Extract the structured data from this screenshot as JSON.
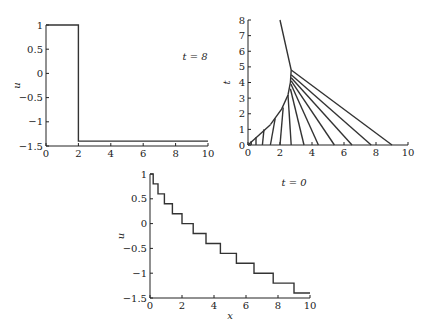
{
  "chart_data": [
    {
      "type": "line",
      "title": "",
      "annotation": "t = 8",
      "xlabel": "",
      "ylabel": "u",
      "xlim": [
        0,
        10
      ],
      "ylim": [
        -1.5,
        1
      ],
      "xticks": [
        "0",
        "2",
        "4",
        "6",
        "8",
        "10"
      ],
      "yticks": [
        "1",
        "0.5",
        "0",
        "−0.5",
        "−1",
        "−1.5"
      ],
      "series": [
        {
          "name": "u(x, t=8)",
          "x": [
            0,
            2,
            2,
            10
          ],
          "y": [
            1,
            1,
            -1.4,
            -1.4
          ]
        }
      ]
    },
    {
      "type": "line",
      "title": "",
      "annotation": "",
      "xlabel": "",
      "ylabel": "t",
      "xlim": [
        0,
        10
      ],
      "ylim": [
        0,
        8
      ],
      "xticks": [
        "0",
        "2",
        "4",
        "6",
        "8",
        "10"
      ],
      "yticks": [
        "0",
        "1",
        "2",
        "3",
        "4",
        "5",
        "6",
        "7",
        "8"
      ],
      "description": "Characteristic lines from x0 = 0, 0.2, 0.5, 0.9, 1.4, 2.0, 2.7, 3.5, 4.4, 5.4, 6.5, 7.7, 9.0 converging into a shock curve, shock continuing to (2, 8)",
      "series": [
        {
          "name": "characteristics",
          "x0": [
            0,
            0.2,
            0.5,
            0.9,
            1.4,
            2.0,
            2.7,
            3.5,
            4.4,
            5.4,
            6.5,
            7.7,
            9.0
          ]
        }
      ]
    },
    {
      "type": "line",
      "title": "",
      "annotation": "t = 0",
      "xlabel": "x",
      "ylabel": "u",
      "xlim": [
        0,
        10
      ],
      "ylim": [
        -1.5,
        1
      ],
      "xticks": [
        "0",
        "2",
        "4",
        "6",
        "8",
        "10"
      ],
      "yticks": [
        "1",
        "0.5",
        "0",
        "−0.5",
        "−1",
        "−1.5"
      ],
      "series": [
        {
          "name": "u(x, t=0)",
          "step_x": [
            0,
            0.2,
            0.5,
            0.9,
            1.4,
            2.0,
            2.7,
            3.5,
            4.4,
            5.4,
            6.5,
            7.7,
            9.0,
            10
          ],
          "step_y": [
            1,
            0.8,
            0.6,
            0.4,
            0.2,
            0,
            -0.2,
            -0.4,
            -0.6,
            -0.8,
            -1,
            -1.2,
            -1.4
          ]
        }
      ]
    }
  ],
  "labels": {
    "p1_annot": "t = 8",
    "p1_ylabel": "u",
    "p2_ylabel": "t",
    "p3_annot": "t = 0",
    "p3_ylabel": "u",
    "p3_xlabel": "x"
  }
}
